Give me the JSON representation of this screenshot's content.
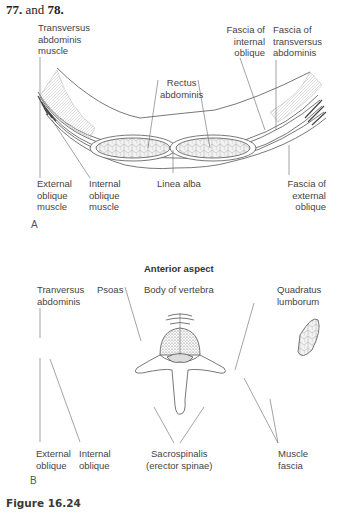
{
  "heading": {
    "prefix": "77.",
    "middle": " and ",
    "suffix": "78."
  },
  "figure_a": {
    "panel_label": "A",
    "labels": {
      "transversus": [
        "Transversus",
        "abdominis",
        "muscle"
      ],
      "rectus": [
        "Rectus",
        "abdominis"
      ],
      "fascia_internal": [
        "Fascia of",
        "internal",
        "oblique"
      ],
      "fascia_transversus": [
        "Fascia of",
        "transversus",
        "abdominis"
      ],
      "external_oblique": [
        "External",
        "oblique",
        "muscle"
      ],
      "internal_oblique": [
        "Internal",
        "oblique",
        "muscle"
      ],
      "linea_alba": [
        "Linea alba"
      ],
      "fascia_external": [
        "Fascia of",
        "external",
        "oblique"
      ]
    }
  },
  "figure_b": {
    "panel_label": "B",
    "title": "Anterior aspect",
    "labels": {
      "tranversus": [
        "Tranversus",
        "abdominis"
      ],
      "psoas": [
        "Psoas"
      ],
      "body_vertebra": [
        "Body of vertebra"
      ],
      "quadratus": [
        "Quadratus",
        "lumborum"
      ],
      "external_oblique": [
        "External",
        "oblique"
      ],
      "internal_oblique": [
        "Internal",
        "oblique"
      ],
      "sacrospinalis": [
        "Sacrospinalis",
        "(erector spinae)"
      ],
      "muscle_fascia": [
        "Muscle",
        "fascia"
      ]
    }
  },
  "caption": "Figure 16.24"
}
